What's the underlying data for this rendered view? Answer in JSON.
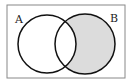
{
  "diagram": {
    "type": "venn",
    "sets": [
      {
        "label": "A",
        "cx": 47,
        "cy": 44,
        "r": 29
      },
      {
        "label": "B",
        "cx": 85,
        "cy": 44,
        "r": 30
      }
    ],
    "shaded_region": "B minus A",
    "shade_color": "#dcdcdc",
    "stroke_color": "#111111",
    "border_color": "#888888"
  },
  "labels": {
    "a": "A",
    "b": "B"
  }
}
